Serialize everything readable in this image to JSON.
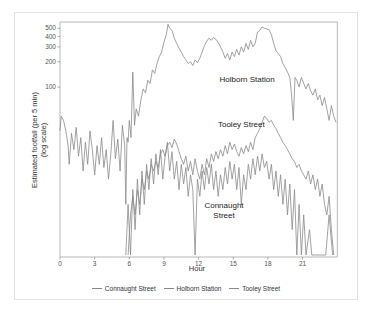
{
  "chart_data": {
    "type": "line",
    "title": "",
    "xlabel": "Hour",
    "ylabel": "Estimated footfall (per 5 min)",
    "ylabel_sub": "(log scale)",
    "y_scale": "log",
    "xlim": [
      0,
      24
    ],
    "ylim": [
      1,
      600
    ],
    "x_ticks": [
      0,
      3,
      6,
      9,
      12,
      15,
      18,
      21
    ],
    "y_ticks": [
      100,
      200,
      300,
      400,
      500
    ],
    "grid": false,
    "legend_position": "bottom",
    "line_color": "#8a8a8a",
    "series": [
      {
        "name": "Connaught Street",
        "label_text": [
          "Connaught",
          "Street"
        ],
        "label_pos": {
          "hour": 14.2,
          "value": 3.6
        },
        "points": [
          [
            5.7,
            1
          ],
          [
            5.9,
            4
          ],
          [
            6.1,
            1
          ],
          [
            6.3,
            6
          ],
          [
            6.5,
            2
          ],
          [
            6.7,
            8
          ],
          [
            6.9,
            3
          ],
          [
            7.1,
            10
          ],
          [
            7.3,
            4
          ],
          [
            7.5,
            12
          ],
          [
            7.7,
            6
          ],
          [
            7.9,
            14
          ],
          [
            8.1,
            7
          ],
          [
            8.3,
            16
          ],
          [
            8.5,
            9
          ],
          [
            8.7,
            18
          ],
          [
            8.9,
            8
          ],
          [
            9.1,
            15
          ],
          [
            9.3,
            22
          ],
          [
            9.5,
            10
          ],
          [
            9.7,
            17
          ],
          [
            9.9,
            8
          ],
          [
            10.1,
            13
          ],
          [
            10.3,
            6
          ],
          [
            10.5,
            12
          ],
          [
            10.7,
            7
          ],
          [
            10.9,
            11
          ],
          [
            11.1,
            5
          ],
          [
            11.3,
            9
          ],
          [
            11.5,
            6
          ],
          [
            11.7,
            1
          ],
          [
            11.9,
            8
          ],
          [
            12.1,
            5
          ],
          [
            12.3,
            10
          ],
          [
            12.5,
            6
          ],
          [
            12.7,
            11
          ],
          [
            12.9,
            7
          ],
          [
            13.1,
            12
          ],
          [
            13.3,
            6
          ],
          [
            13.5,
            10
          ],
          [
            13.7,
            5
          ],
          [
            13.9,
            9
          ],
          [
            14.1,
            6
          ],
          [
            14.3,
            11
          ],
          [
            14.5,
            7
          ],
          [
            14.7,
            13
          ],
          [
            14.9,
            8
          ],
          [
            15.1,
            12
          ],
          [
            15.3,
            6
          ],
          [
            15.5,
            11
          ],
          [
            15.7,
            4
          ],
          [
            15.9,
            9
          ],
          [
            16.1,
            6
          ],
          [
            16.3,
            12
          ],
          [
            16.5,
            8
          ],
          [
            16.7,
            14
          ],
          [
            16.9,
            9
          ],
          [
            17.1,
            15
          ],
          [
            17.3,
            10
          ],
          [
            17.5,
            16
          ],
          [
            17.7,
            11
          ],
          [
            17.9,
            13
          ],
          [
            18.1,
            8
          ],
          [
            18.3,
            12
          ],
          [
            18.5,
            6
          ],
          [
            18.7,
            10
          ],
          [
            18.9,
            5
          ],
          [
            19.1,
            9
          ],
          [
            19.3,
            4
          ],
          [
            19.5,
            8
          ],
          [
            19.7,
            3
          ],
          [
            19.9,
            7
          ],
          [
            20.1,
            2
          ],
          [
            20.3,
            6
          ],
          [
            20.5,
            1
          ],
          [
            20.7,
            4
          ],
          [
            20.9,
            1
          ],
          [
            21.1,
            3
          ],
          [
            21.3,
            1
          ],
          [
            21.6,
            2
          ],
          [
            21.8,
            1
          ],
          [
            23.0,
            1
          ],
          [
            23.3,
            3
          ],
          [
            23.6,
            1
          ]
        ]
      },
      {
        "name": "Holborn Station",
        "label_text": [
          "Holborn Station"
        ],
        "label_pos": {
          "hour": 16.2,
          "value": 115
        },
        "points": [
          [
            0,
            30
          ],
          [
            0.1,
            45
          ],
          [
            0.3,
            40
          ],
          [
            0.5,
            30
          ],
          [
            0.7,
            20
          ],
          [
            0.8,
            12
          ],
          [
            1.0,
            28
          ],
          [
            1.2,
            18
          ],
          [
            1.4,
            33
          ],
          [
            1.6,
            15
          ],
          [
            1.8,
            25
          ],
          [
            2.0,
            10
          ],
          [
            2.2,
            22
          ],
          [
            2.4,
            12
          ],
          [
            2.6,
            30
          ],
          [
            2.8,
            18
          ],
          [
            3.0,
            9
          ],
          [
            3.2,
            20
          ],
          [
            3.4,
            12
          ],
          [
            3.6,
            25
          ],
          [
            3.8,
            11
          ],
          [
            4.0,
            18
          ],
          [
            4.2,
            8
          ],
          [
            4.4,
            16
          ],
          [
            4.6,
            40
          ],
          [
            4.8,
            14
          ],
          [
            5.0,
            24
          ],
          [
            5.2,
            10
          ],
          [
            5.4,
            35
          ],
          [
            5.6,
            20
          ],
          [
            5.7,
            4
          ],
          [
            5.8,
            25
          ],
          [
            5.9,
            22
          ],
          [
            6.0,
            40
          ],
          [
            6.15,
            25
          ],
          [
            6.3,
            150
          ],
          [
            6.45,
            35
          ],
          [
            6.6,
            55
          ],
          [
            6.8,
            45
          ],
          [
            7.0,
            70
          ],
          [
            7.2,
            95
          ],
          [
            7.4,
            85
          ],
          [
            7.6,
            120
          ],
          [
            7.8,
            110
          ],
          [
            8.0,
            160
          ],
          [
            8.2,
            145
          ],
          [
            8.4,
            190
          ],
          [
            8.6,
            230
          ],
          [
            8.8,
            260
          ],
          [
            9.0,
            340
          ],
          [
            9.2,
            420
          ],
          [
            9.35,
            560
          ],
          [
            9.5,
            500
          ],
          [
            9.7,
            470
          ],
          [
            9.9,
            380
          ],
          [
            10.1,
            330
          ],
          [
            10.3,
            290
          ],
          [
            10.5,
            260
          ],
          [
            10.7,
            230
          ],
          [
            10.9,
            210
          ],
          [
            11.1,
            190
          ],
          [
            11.3,
            200
          ],
          [
            11.5,
            180
          ],
          [
            11.7,
            210
          ],
          [
            11.9,
            195
          ],
          [
            12.1,
            220
          ],
          [
            12.3,
            260
          ],
          [
            12.5,
            310
          ],
          [
            12.7,
            350
          ],
          [
            12.9,
            380
          ],
          [
            13.1,
            360
          ],
          [
            13.3,
            390
          ],
          [
            13.5,
            370
          ],
          [
            13.7,
            340
          ],
          [
            13.9,
            300
          ],
          [
            14.1,
            260
          ],
          [
            14.3,
            220
          ],
          [
            14.5,
            250
          ],
          [
            14.7,
            210
          ],
          [
            14.9,
            260
          ],
          [
            15.1,
            230
          ],
          [
            15.3,
            280
          ],
          [
            15.5,
            240
          ],
          [
            15.7,
            300
          ],
          [
            15.9,
            260
          ],
          [
            16.1,
            330
          ],
          [
            16.3,
            280
          ],
          [
            16.5,
            360
          ],
          [
            16.7,
            300
          ],
          [
            16.9,
            330
          ],
          [
            17.1,
            450
          ],
          [
            17.3,
            470
          ],
          [
            17.5,
            520
          ],
          [
            17.7,
            500
          ],
          [
            17.9,
            490
          ],
          [
            18.1,
            480
          ],
          [
            18.3,
            420
          ],
          [
            18.5,
            330
          ],
          [
            18.7,
            270
          ],
          [
            18.9,
            250
          ],
          [
            19.1,
            230
          ],
          [
            19.3,
            190
          ],
          [
            19.5,
            170
          ],
          [
            19.7,
            150
          ],
          [
            19.9,
            130
          ],
          [
            20.05,
            80
          ],
          [
            20.2,
            40
          ],
          [
            20.35,
            130
          ],
          [
            20.5,
            120
          ],
          [
            20.7,
            100
          ],
          [
            20.9,
            130
          ],
          [
            21.1,
            110
          ],
          [
            21.3,
            95
          ],
          [
            21.5,
            110
          ],
          [
            21.7,
            90
          ],
          [
            21.9,
            80
          ],
          [
            22.1,
            95
          ],
          [
            22.3,
            70
          ],
          [
            22.5,
            80
          ],
          [
            22.7,
            60
          ],
          [
            22.9,
            75
          ],
          [
            23.1,
            55
          ],
          [
            23.3,
            40
          ],
          [
            23.5,
            60
          ],
          [
            23.7,
            45
          ],
          [
            23.9,
            38
          ]
        ]
      },
      {
        "name": "Tooley Street",
        "label_text": [
          "Tooley Street"
        ],
        "label_pos": {
          "hour": 15.7,
          "value": 33
        },
        "points": [
          [
            5.9,
            1
          ],
          [
            6.1,
            3
          ],
          [
            6.3,
            5
          ],
          [
            6.5,
            3
          ],
          [
            6.7,
            6
          ],
          [
            6.9,
            4
          ],
          [
            7.1,
            8
          ],
          [
            7.3,
            6
          ],
          [
            7.5,
            10
          ],
          [
            7.7,
            8
          ],
          [
            7.9,
            12
          ],
          [
            8.1,
            10
          ],
          [
            8.3,
            13
          ],
          [
            8.5,
            11
          ],
          [
            8.7,
            16
          ],
          [
            8.9,
            18
          ],
          [
            9.1,
            15
          ],
          [
            9.3,
            20
          ],
          [
            9.5,
            22
          ],
          [
            9.7,
            19
          ],
          [
            9.9,
            24
          ],
          [
            10.1,
            21
          ],
          [
            10.3,
            17
          ],
          [
            10.5,
            14
          ],
          [
            10.7,
            12
          ],
          [
            10.9,
            15
          ],
          [
            11.1,
            10
          ],
          [
            11.3,
            13
          ],
          [
            11.5,
            9
          ],
          [
            11.7,
            14
          ],
          [
            11.9,
            10
          ],
          [
            12.1,
            8
          ],
          [
            12.3,
            12
          ],
          [
            12.5,
            9
          ],
          [
            12.7,
            14
          ],
          [
            12.9,
            11
          ],
          [
            13.1,
            16
          ],
          [
            13.3,
            13
          ],
          [
            13.5,
            17
          ],
          [
            13.7,
            14
          ],
          [
            13.9,
            18
          ],
          [
            14.1,
            15
          ],
          [
            14.3,
            20
          ],
          [
            14.5,
            16
          ],
          [
            14.7,
            22
          ],
          [
            14.9,
            18
          ],
          [
            15.1,
            21
          ],
          [
            15.3,
            17
          ],
          [
            15.5,
            15
          ],
          [
            15.7,
            19
          ],
          [
            15.9,
            16
          ],
          [
            16.1,
            20
          ],
          [
            16.3,
            17
          ],
          [
            16.5,
            22
          ],
          [
            16.7,
            18
          ],
          [
            16.9,
            25
          ],
          [
            17.1,
            28
          ],
          [
            17.3,
            32
          ],
          [
            17.5,
            38
          ],
          [
            17.7,
            45
          ],
          [
            17.9,
            42
          ],
          [
            18.1,
            38
          ],
          [
            18.3,
            40
          ],
          [
            18.5,
            35
          ],
          [
            18.7,
            32
          ],
          [
            18.9,
            28
          ],
          [
            19.1,
            25
          ],
          [
            19.3,
            22
          ],
          [
            19.5,
            20
          ],
          [
            19.7,
            18
          ],
          [
            19.9,
            16
          ],
          [
            20.1,
            14
          ],
          [
            20.3,
            13
          ],
          [
            20.5,
            11
          ],
          [
            20.7,
            12
          ],
          [
            20.9,
            10
          ],
          [
            21.1,
            9
          ],
          [
            21.3,
            8
          ],
          [
            21.5,
            10
          ],
          [
            21.7,
            7
          ],
          [
            21.9,
            9
          ],
          [
            22.1,
            6
          ],
          [
            22.3,
            8
          ],
          [
            22.5,
            5
          ],
          [
            22.7,
            7
          ],
          [
            22.9,
            4
          ],
          [
            23.1,
            3
          ],
          [
            23.3,
            5
          ],
          [
            23.5,
            2
          ],
          [
            23.7,
            1
          ]
        ]
      }
    ]
  },
  "legend": {
    "items": [
      "Connaught Street",
      "Holborn Station",
      "Tooley Street"
    ]
  }
}
